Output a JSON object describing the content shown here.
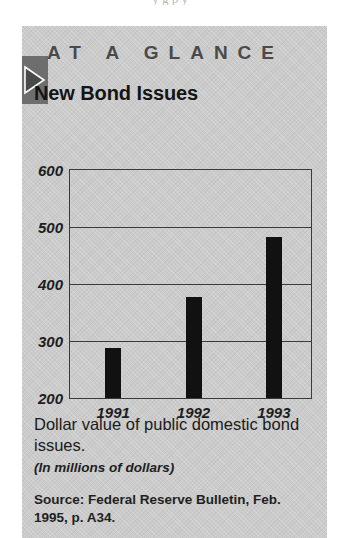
{
  "page": {
    "bleed_text": "y                    g      p  y"
  },
  "panel": {
    "header": "AT A GLANCE",
    "title": "New Bond Issues",
    "arrow_icon": "triangle-right-icon",
    "background_color": "#cbcbcb",
    "arrow_tab_color": "#6e6e6e"
  },
  "caption": {
    "main": "Dollar value of public domestic bond issues.",
    "units": "(In millions of dollars)",
    "source": "Source: Federal Reserve Bulletin, Feb. 1995, p. A34."
  },
  "chart_data": {
    "type": "bar",
    "title": "New Bond Issues",
    "subtitle": "Dollar value of public domestic bond issues.",
    "xlabel": "",
    "ylabel": "(In millions of dollars)",
    "categories": [
      "1991",
      "1992",
      "1993"
    ],
    "values": [
      288,
      377,
      483
    ],
    "ylim": [
      200,
      600
    ],
    "yticks": [
      200,
      300,
      400,
      500,
      600
    ],
    "ytick_labels": [
      "200",
      "300",
      "400",
      "500",
      "600"
    ],
    "grid": true,
    "grid_axis": "y",
    "legend": false,
    "bar_color": "#111111",
    "axis_color": "#3a3a3a",
    "source": "Source: Federal Reserve Bulletin, Feb. 1995, p. A34."
  }
}
